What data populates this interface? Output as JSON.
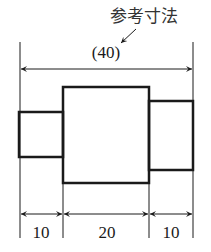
{
  "annotation": {
    "label": "参考寸法",
    "meaning": "reference dimension"
  },
  "dimensions": {
    "overall": "(40)",
    "left": "10",
    "middle": "20",
    "right": "10"
  },
  "colors": {
    "line": "#1a1a1a",
    "background": "#ffffff"
  }
}
